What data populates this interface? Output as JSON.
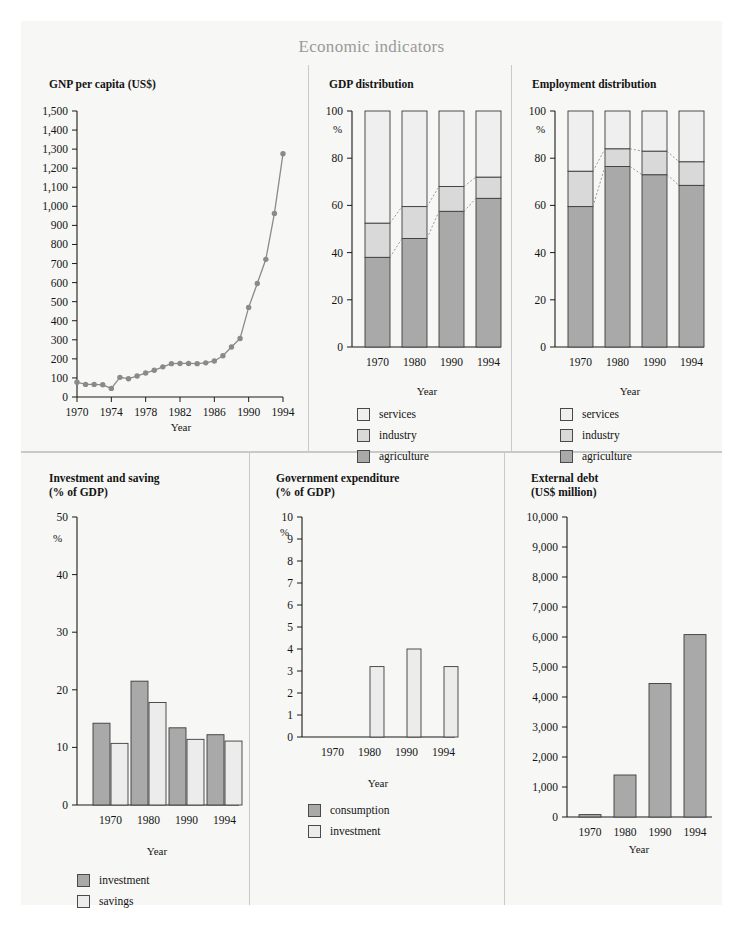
{
  "title": "Economic indicators",
  "colors": {
    "sheet_bg": "#f7f7f5",
    "divider": "#c9c9c9",
    "axis": "#1a1a1a",
    "agriculture": "#a9a9a9",
    "industry": "#d9d9d9",
    "services": "#efefef",
    "investment": "#a9a9a9",
    "savings": "#ececec",
    "consumption": "#a9a9a9",
    "line": "#8a8a8a",
    "marker": "#8a8a8a",
    "title_color": "#9a9a9a"
  },
  "panels": [
    {
      "id": "gnp-per-capita",
      "title": "GNP per capita (US$)"
    },
    {
      "id": "gdp-distribution",
      "title": "GDP distribution"
    },
    {
      "id": "employment-distribution",
      "title": "Employment distribution"
    },
    {
      "id": "investment-and-saving",
      "title": "Investment and saving\n(% of GDP)"
    },
    {
      "id": "government-expenditure",
      "title": "Government expenditure\n(% of GDP)"
    },
    {
      "id": "external-debt",
      "title": "External debt\n(US$ million)"
    }
  ],
  "chart_data": [
    {
      "type": "line",
      "id": "gnp-per-capita",
      "title": "GNP per capita (US$)",
      "xlabel": "Year",
      "ylabel": "",
      "unit": "US$",
      "xlim": [
        1970,
        1994
      ],
      "ylim": [
        0,
        1500
      ],
      "xticks": [
        1970,
        1974,
        1978,
        1982,
        1986,
        1990,
        1994
      ],
      "xtick_labels": [
        "1970",
        "1974",
        "1978",
        "1982",
        "1986",
        "1990",
        "1994"
      ],
      "yticks": [
        0,
        100,
        200,
        300,
        400,
        500,
        600,
        700,
        800,
        900,
        1000,
        1100,
        1200,
        1300,
        1400,
        1500
      ],
      "ytick_labels": [
        "0",
        "100",
        "200",
        "300",
        "400",
        "500",
        "600",
        "700",
        "800",
        "900",
        "1,000",
        "1,100",
        "1,200",
        "1,300",
        "1,400",
        "1,500"
      ],
      "grid": false,
      "markers": true,
      "x": [
        1970,
        1971,
        1972,
        1973,
        1974,
        1975,
        1976,
        1977,
        1978,
        1979,
        1980,
        1981,
        1982,
        1983,
        1984,
        1985,
        1986,
        1987,
        1988,
        1989,
        1990,
        1991,
        1992,
        1993,
        1994
      ],
      "values": [
        78,
        66,
        66,
        64,
        45,
        103,
        96,
        110,
        126,
        140,
        158,
        175,
        176,
        176,
        175,
        179,
        189,
        216,
        262,
        307,
        470,
        595,
        722,
        963,
        1276
      ]
    },
    {
      "type": "bar",
      "subtype": "stacked",
      "id": "gdp-distribution",
      "title": "GDP distribution",
      "xlabel": "Year",
      "ylabel": "%",
      "ylim": [
        0,
        100
      ],
      "yticks": [
        0,
        20,
        40,
        60,
        80,
        100
      ],
      "ytick_labels": [
        "0",
        "20",
        "40",
        "60",
        "80",
        "100"
      ],
      "categories": [
        "1970",
        "1980",
        "1990",
        "1994"
      ],
      "legend_position": "below",
      "series": [
        {
          "name": "agriculture",
          "values": [
            38,
            46,
            57.5,
            63
          ]
        },
        {
          "name": "industry",
          "values": [
            14.5,
            13.5,
            10.5,
            9
          ]
        },
        {
          "name": "services",
          "values": [
            47.5,
            40.5,
            32,
            28
          ]
        }
      ],
      "cumulative_tops": [
        {
          "name": "agriculture",
          "values": [
            38,
            46,
            57.5,
            63
          ]
        },
        {
          "name": "industry",
          "values": [
            52.5,
            59.5,
            68,
            72
          ]
        }
      ],
      "legend": [
        "services",
        "industry",
        "agriculture"
      ]
    },
    {
      "type": "bar",
      "subtype": "stacked",
      "id": "employment-distribution",
      "title": "Employment distribution",
      "xlabel": "Year",
      "ylabel": "%",
      "ylim": [
        0,
        100
      ],
      "yticks": [
        0,
        20,
        40,
        60,
        80,
        100
      ],
      "ytick_labels": [
        "0",
        "20",
        "40",
        "60",
        "80",
        "100"
      ],
      "categories": [
        "1970",
        "1980",
        "1990",
        "1994"
      ],
      "legend_position": "below",
      "series": [
        {
          "name": "agriculture",
          "values": [
            59.5,
            76.5,
            73,
            68.5
          ]
        },
        {
          "name": "industry",
          "values": [
            15,
            7.5,
            10,
            10
          ]
        },
        {
          "name": "services",
          "values": [
            25.5,
            16,
            17,
            21.5
          ]
        }
      ],
      "cumulative_tops": [
        {
          "name": "agriculture",
          "values": [
            59.5,
            76.5,
            73,
            68.5
          ]
        },
        {
          "name": "industry",
          "values": [
            74.5,
            84,
            83,
            78.5
          ]
        }
      ],
      "legend": [
        "services",
        "industry",
        "agriculture"
      ]
    },
    {
      "type": "bar",
      "subtype": "grouped",
      "id": "investment-and-saving",
      "title": "Investment and saving (% of GDP)",
      "xlabel": "Year",
      "ylabel": "%",
      "ylim": [
        0,
        50
      ],
      "yticks": [
        0,
        10,
        20,
        30,
        40,
        50
      ],
      "ytick_labels": [
        "0",
        "10",
        "20",
        "30",
        "40",
        "50"
      ],
      "categories": [
        "1970",
        "1980",
        "1990",
        "1994"
      ],
      "legend_position": "below",
      "series": [
        {
          "name": "investment",
          "values": [
            14.2,
            21.5,
            13.4,
            12.2
          ]
        },
        {
          "name": "savings",
          "values": [
            10.7,
            17.8,
            11.4,
            11.1
          ]
        }
      ],
      "legend": [
        "investment",
        "savings"
      ]
    },
    {
      "type": "bar",
      "subtype": "grouped",
      "id": "government-expenditure",
      "title": "Government expenditure (% of GDP)",
      "xlabel": "Year",
      "ylabel": "%",
      "ylim": [
        0,
        10
      ],
      "yticks": [
        0,
        1,
        2,
        3,
        4,
        5,
        6,
        7,
        8,
        9,
        10
      ],
      "ytick_labels": [
        "0",
        "1",
        "2",
        "3",
        "4",
        "5",
        "6",
        "7",
        "8",
        "9",
        "10"
      ],
      "categories": [
        "1970",
        "1980",
        "1990",
        "1994"
      ],
      "legend_position": "below",
      "series": [
        {
          "name": "consumption",
          "values": [
            0,
            0,
            0,
            0
          ]
        },
        {
          "name": "investment",
          "values": [
            0,
            3.2,
            4.0,
            3.2
          ]
        }
      ],
      "legend": [
        "consumption",
        "investment"
      ]
    },
    {
      "type": "bar",
      "id": "external-debt",
      "title": "External debt (US$ million)",
      "xlabel": "Year",
      "ylabel": "",
      "ylim": [
        0,
        10000
      ],
      "yticks": [
        0,
        1000,
        2000,
        3000,
        4000,
        5000,
        6000,
        7000,
        8000,
        9000,
        10000
      ],
      "ytick_labels": [
        "0",
        "1,000",
        "2,000",
        "3,000",
        "4,000",
        "5,000",
        "6,000",
        "7,000",
        "8,000",
        "9,000",
        "10,000"
      ],
      "categories": [
        "1970",
        "1980",
        "1990",
        "1994"
      ],
      "values": [
        80,
        1400,
        4450,
        6080
      ]
    }
  ],
  "axis_titles": {
    "year": "Year",
    "percent": "%"
  }
}
